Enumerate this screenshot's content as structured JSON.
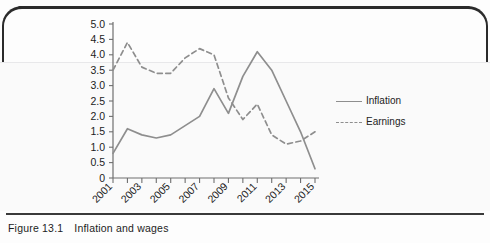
{
  "figure": {
    "caption_number": "Figure 13.1",
    "caption_text": "Inflation and wages"
  },
  "legend": {
    "inflation_label": "Inflation",
    "earnings_label": "Earnings"
  },
  "chart_data": {
    "type": "line",
    "title": "",
    "xlabel": "",
    "ylabel": "",
    "xlim": [
      2001,
      2015
    ],
    "ylim": [
      0,
      5.0
    ],
    "ytick_labels": [
      "0",
      "0.5",
      "1.0",
      "1.5",
      "2.0",
      "2.5",
      "3.0",
      "3.5",
      "4.0",
      "4.5",
      "5.0"
    ],
    "ytick_values": [
      0,
      0.5,
      1.0,
      1.5,
      2.0,
      2.5,
      3.0,
      3.5,
      4.0,
      4.5,
      5.0
    ],
    "xtick_labels": [
      "2001",
      "2003",
      "2005",
      "2007",
      "2009",
      "2011",
      "2013",
      "2015"
    ],
    "xtick_values": [
      2001,
      2003,
      2005,
      2007,
      2009,
      2011,
      2013,
      2015
    ],
    "x_minor_ticks": [
      2002,
      2004,
      2006,
      2008,
      2010,
      2012,
      2014
    ],
    "grid": false,
    "legend_position": "right",
    "x": [
      2001,
      2002,
      2003,
      2004,
      2005,
      2006,
      2007,
      2008,
      2009,
      2010,
      2011,
      2012,
      2013,
      2014,
      2015
    ],
    "series": [
      {
        "name": "Inflation",
        "style": "solid",
        "color": "#8e8e8e",
        "values": [
          0.8,
          1.6,
          1.4,
          1.3,
          1.4,
          1.7,
          2.0,
          2.9,
          2.1,
          3.3,
          4.1,
          3.5,
          2.5,
          1.5,
          0.3
        ]
      },
      {
        "name": "Earnings",
        "style": "dashed",
        "color": "#8e8e8e",
        "values": [
          3.5,
          4.4,
          3.6,
          3.4,
          3.4,
          3.9,
          4.2,
          4.0,
          2.6,
          1.9,
          2.4,
          1.4,
          1.1,
          1.2,
          1.5
        ]
      }
    ]
  },
  "axis_style": {
    "line_color": "#6f6f6f",
    "tick_label_color": "#1c1c1c",
    "plot_background": "#fafafa"
  }
}
